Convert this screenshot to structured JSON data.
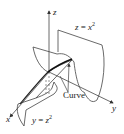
{
  "figure": {
    "axes": {
      "x_label": "x",
      "y_label": "y",
      "z_label": "z"
    },
    "surfaces": [
      {
        "name": "parabolic-cylinder-z",
        "label_lhs": "z",
        "label_eq": " = ",
        "label_var": "x",
        "label_exp": "2"
      },
      {
        "name": "parabolic-cylinder-y",
        "label_lhs": "y",
        "label_eq": " = ",
        "label_var": "z",
        "label_exp": "2"
      }
    ],
    "curve_label": "Curve",
    "colors": {
      "line": "#333333",
      "background": "#ffffff"
    }
  }
}
